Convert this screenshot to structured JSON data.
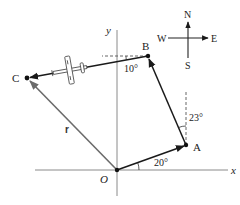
{
  "diagram": {
    "axes": {
      "x_label": "x",
      "y_label": "y",
      "origin_label": "O"
    },
    "points": {
      "O": {
        "label": "O",
        "x": 117,
        "y": 170
      },
      "A": {
        "label": "A",
        "x": 186,
        "y": 145
      },
      "B": {
        "label": "B",
        "x": 148,
        "y": 56
      },
      "C": {
        "label": "C",
        "x": 27,
        "y": 78
      }
    },
    "vectors": [
      {
        "from": "O",
        "to": "A",
        "angle_label": "20°",
        "reference": "x-axis"
      },
      {
        "from": "A",
        "to": "B",
        "angle_label": "23°",
        "reference": "north (vertical)"
      },
      {
        "from": "B",
        "to": "C",
        "angle_label": "10°",
        "reference": "west (horizontal)"
      },
      {
        "from": "O",
        "to": "C",
        "label": "r"
      }
    ],
    "compass": {
      "north": "N",
      "south": "S",
      "east": "E",
      "west": "W"
    },
    "angle_labels": {
      "oa": "20°",
      "ab": "23°",
      "bc": "10°"
    },
    "resultant_label": "r",
    "colors": {
      "line": "#1a1a1a",
      "resultant": "#6b6b6b",
      "axis": "#8a8a8a",
      "dashed": "#555555"
    }
  }
}
